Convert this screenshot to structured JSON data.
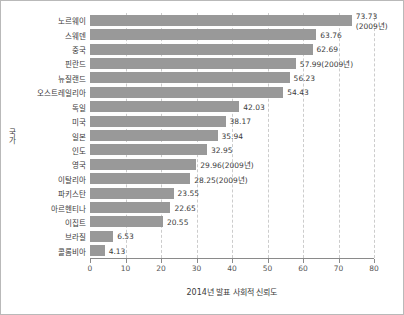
{
  "chart_data": {
    "type": "bar",
    "orientation": "horizontal",
    "title": "",
    "xlabel": "2014년 발표 사회적 신뢰도",
    "ylabel": "국가",
    "xlim": [
      0,
      80
    ],
    "xticks": [
      0,
      10,
      20,
      30,
      40,
      50,
      60,
      70,
      80
    ],
    "grid": "vertical-dashed",
    "legend": "none",
    "bar_color": "#999999",
    "categories": [
      "노르웨이",
      "스웨덴",
      "중국",
      "핀란드",
      "뉴질랜드",
      "오스트레일리아",
      "독일",
      "미국",
      "일본",
      "인도",
      "영국",
      "이탈리아",
      "파키스탄",
      "아르헨티나",
      "이집트",
      "브라질",
      "콜롬비아"
    ],
    "values": [
      73.73,
      63.76,
      62.69,
      57.99,
      56.23,
      54.43,
      42.03,
      38.17,
      35.94,
      32.95,
      29.96,
      28.25,
      23.55,
      22.65,
      20.55,
      6.53,
      4.13
    ],
    "data_labels": [
      "73.73",
      "63.76",
      "62.69",
      "57.99(2009년)",
      "56.23",
      "54.43",
      "42.03",
      "38.17",
      "35.94",
      "32.95",
      "29.96(2009년)",
      "28.25(2009년)",
      "23.55",
      "22.65",
      "20.55",
      "6.53",
      "4.13"
    ],
    "annotations": [
      {
        "category": "노르웨이",
        "note": "(2009년)"
      }
    ]
  }
}
